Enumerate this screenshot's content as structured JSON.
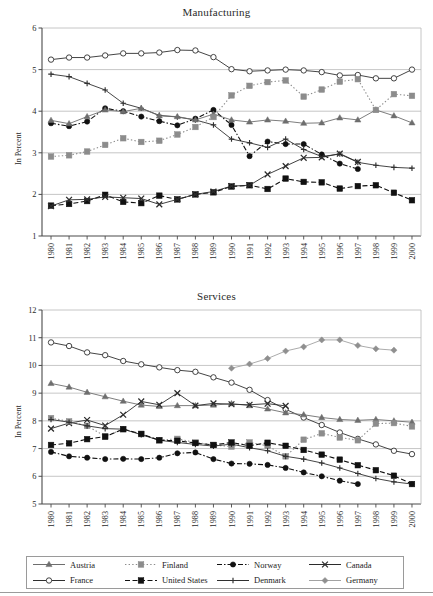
{
  "figure": {
    "ylabel": "In Percent",
    "x_tick_labels": [
      "1980",
      "1981",
      "1982",
      "1983",
      "1984",
      "1985",
      "1986",
      "1987",
      "1988",
      "1989",
      "1990",
      "1991",
      "1992",
      "1993",
      "1994",
      "1995",
      "1996",
      "1997",
      "1998",
      "1999",
      "2000"
    ]
  },
  "legend": {
    "items": [
      {
        "label": "Austria",
        "marker": "triangle",
        "color": "#6f6f6f",
        "line": "solid"
      },
      {
        "label": "Finland",
        "marker": "square",
        "color": "#8a8a8a",
        "line": "dotted"
      },
      {
        "label": "Norway",
        "marker": "circle",
        "color": "#111111",
        "line": "dashdot"
      },
      {
        "label": "Canada",
        "marker": "x",
        "color": "#2b2b2b",
        "line": "solid"
      },
      {
        "label": "France",
        "marker": "open-circle",
        "color": "#2b2b2b",
        "line": "solid"
      },
      {
        "label": "United States",
        "marker": "square",
        "color": "#111111",
        "line": "dashed"
      },
      {
        "label": "Denmark",
        "marker": "plus",
        "color": "#2b2b2b",
        "line": "solid"
      },
      {
        "label": "Germany",
        "marker": "diamond",
        "color": "#9a9a9a",
        "line": "solid"
      }
    ]
  },
  "chart_data": [
    {
      "type": "line",
      "title": "Manufacturing",
      "xlabel": "",
      "ylabel": "In Percent",
      "ylim": [
        1,
        6
      ],
      "yticks": [
        1,
        2,
        3,
        4,
        5,
        6
      ],
      "grid": true,
      "legend_position": "bottom",
      "x": [
        "1980",
        "1981",
        "1982",
        "1983",
        "1984",
        "1985",
        "1986",
        "1987",
        "1988",
        "1989",
        "1990",
        "1991",
        "1992",
        "1993",
        "1994",
        "1995",
        "1996",
        "1997",
        "1998",
        "1999",
        "2000"
      ],
      "series": [
        {
          "name": "France",
          "marker": "open-circle",
          "values": [
            5.24,
            5.29,
            5.29,
            5.34,
            5.39,
            5.39,
            5.41,
            5.47,
            5.46,
            5.3,
            5.01,
            4.96,
            4.98,
            5.0,
            4.98,
            4.94,
            4.86,
            4.87,
            4.79,
            4.79,
            5.0
          ]
        },
        {
          "name": "Denmark",
          "marker": "plus",
          "values": [
            4.89,
            4.83,
            4.67,
            4.51,
            4.19,
            4.07,
            3.9,
            3.86,
            3.79,
            3.67,
            3.33,
            3.24,
            3.13,
            3.33,
            3.08,
            2.91,
            2.97,
            2.77,
            2.7,
            2.65,
            2.63
          ]
        },
        {
          "name": "Norway",
          "marker": "circle",
          "values": [
            3.71,
            3.64,
            3.75,
            4.07,
            4.0,
            3.87,
            3.76,
            3.66,
            3.82,
            4.03,
            3.67,
            2.92,
            3.27,
            3.21,
            3.21,
            2.96,
            2.74,
            2.61,
            null,
            null,
            null
          ]
        },
        {
          "name": "Austria",
          "marker": "triangle",
          "values": [
            3.78,
            3.7,
            3.87,
            4.03,
            3.99,
            4.07,
            3.89,
            3.87,
            3.79,
            3.93,
            3.79,
            3.74,
            3.79,
            3.76,
            3.71,
            3.72,
            3.84,
            3.79,
            4.03,
            3.89,
            3.72
          ]
        },
        {
          "name": "Finland",
          "marker": "square",
          "values": [
            2.91,
            2.94,
            3.03,
            3.19,
            3.35,
            3.26,
            3.29,
            3.44,
            3.62,
            3.86,
            4.38,
            4.61,
            4.7,
            4.74,
            4.35,
            4.52,
            4.71,
            4.77,
            4.03,
            4.41,
            4.37
          ]
        },
        {
          "name": "United States",
          "marker": "square",
          "values": [
            1.73,
            1.77,
            1.84,
            1.99,
            1.82,
            1.79,
            1.97,
            1.88,
            2.0,
            2.05,
            2.19,
            2.22,
            2.13,
            2.38,
            2.3,
            2.29,
            2.14,
            2.2,
            2.22,
            2.04,
            1.86
          ]
        },
        {
          "name": "Canada",
          "marker": "x",
          "values": [
            1.72,
            1.87,
            1.88,
            1.94,
            1.92,
            1.9,
            1.76,
            1.88,
            2.0,
            2.07,
            2.2,
            2.22,
            2.48,
            2.68,
            2.88,
            2.89,
            2.98,
            2.78,
            null,
            null,
            null
          ]
        }
      ]
    },
    {
      "type": "line",
      "title": "Services",
      "xlabel": "",
      "ylabel": "In Percent",
      "ylim": [
        5,
        12
      ],
      "yticks": [
        5,
        6,
        7,
        8,
        9,
        10,
        11,
        12
      ],
      "grid": true,
      "legend_position": "bottom",
      "x": [
        "1980",
        "1981",
        "1982",
        "1983",
        "1984",
        "1985",
        "1986",
        "1987",
        "1988",
        "1989",
        "1990",
        "1991",
        "1992",
        "1993",
        "1994",
        "1995",
        "1996",
        "1997",
        "1998",
        "1999",
        "2000"
      ],
      "series": [
        {
          "name": "France",
          "marker": "open-circle",
          "values": [
            10.83,
            10.7,
            10.47,
            10.37,
            10.16,
            10.04,
            9.93,
            9.83,
            9.77,
            9.57,
            9.38,
            9.12,
            8.75,
            8.42,
            8.12,
            7.85,
            7.58,
            7.35,
            7.15,
            6.92,
            6.8
          ]
        },
        {
          "name": "Austria",
          "marker": "triangle",
          "values": [
            9.35,
            9.22,
            9.03,
            8.87,
            8.71,
            8.57,
            8.52,
            8.55,
            8.55,
            8.57,
            8.62,
            8.55,
            8.43,
            8.29,
            8.22,
            8.12,
            8.05,
            8.02,
            8.05,
            8.0,
            7.95
          ]
        },
        {
          "name": "Canada",
          "marker": "x",
          "values": [
            7.72,
            7.92,
            8.03,
            7.83,
            8.22,
            8.7,
            8.58,
            9.0,
            8.55,
            8.63,
            8.6,
            8.58,
            8.62,
            8.54,
            null,
            null,
            null,
            null,
            null,
            null,
            null
          ]
        },
        {
          "name": "Finland",
          "marker": "square",
          "values": [
            8.1,
            7.98,
            7.82,
            7.44,
            7.7,
            7.52,
            7.3,
            7.35,
            7.22,
            7.13,
            7.07,
            7.22,
            7.1,
            6.72,
            7.32,
            7.55,
            7.4,
            7.3,
            7.9,
            7.92,
            7.8
          ]
        },
        {
          "name": "Denmark",
          "marker": "plus",
          "values": [
            8.05,
            7.95,
            7.82,
            7.72,
            7.7,
            7.5,
            7.3,
            7.22,
            7.15,
            7.09,
            7.16,
            7.03,
            6.92,
            6.72,
            6.62,
            6.48,
            6.3,
            6.1,
            5.92,
            5.8,
            5.72
          ]
        },
        {
          "name": "United States",
          "marker": "square",
          "values": [
            7.13,
            7.19,
            7.34,
            7.43,
            7.7,
            7.53,
            7.3,
            7.28,
            7.2,
            7.13,
            7.22,
            7.1,
            7.21,
            7.1,
            6.95,
            6.78,
            6.6,
            6.4,
            6.22,
            6.02,
            5.72
          ]
        },
        {
          "name": "Norway",
          "marker": "circle",
          "values": [
            6.88,
            6.72,
            6.67,
            6.62,
            6.63,
            6.62,
            6.67,
            6.83,
            6.86,
            6.62,
            6.46,
            6.45,
            6.41,
            6.3,
            6.14,
            6.0,
            5.84,
            5.72,
            null,
            null,
            null
          ]
        },
        {
          "name": "Germany",
          "marker": "diamond",
          "values": [
            null,
            null,
            null,
            null,
            null,
            null,
            null,
            null,
            null,
            null,
            9.9,
            10.05,
            10.25,
            10.52,
            10.67,
            10.92,
            10.92,
            10.72,
            10.6,
            10.55,
            null
          ]
        }
      ]
    }
  ]
}
